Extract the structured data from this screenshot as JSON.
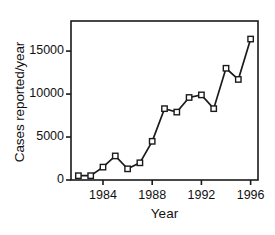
{
  "chart_data": {
    "type": "line",
    "title": "",
    "xlabel": "Year",
    "ylabel": "Cases reported/year",
    "xlim": [
      1981.4,
      1996.6
    ],
    "ylim": [
      0,
      18500
    ],
    "grid": false,
    "legend": null,
    "xticks": [
      1984,
      1988,
      1992,
      1996
    ],
    "xticklabels": [
      "1984",
      "1988",
      "1992",
      "1996"
    ],
    "yticks": [
      0,
      5000,
      10000,
      15000
    ],
    "yticklabels": [
      "0",
      "5000",
      "10000",
      "15000"
    ],
    "marker": "open-square",
    "line_color": "#1a1a1a",
    "marker_face_color": "#ffffff",
    "marker_edge_color": "#1a1a1a",
    "x": [
      1982,
      1983,
      1984,
      1985,
      1986,
      1987,
      1988,
      1989,
      1990,
      1991,
      1992,
      1993,
      1994,
      1995,
      1996
    ],
    "values": [
      500,
      500,
      1500,
      2800,
      1300,
      2000,
      4500,
      8300,
      7900,
      9600,
      9900,
      8300,
      13000,
      11700,
      16400
    ],
    "series": [
      {
        "name": "Cases reported/year",
        "values": [
          500,
          500,
          1500,
          2800,
          1300,
          2000,
          4500,
          8300,
          7900,
          9600,
          9900,
          8300,
          13000,
          11700,
          16400
        ]
      }
    ]
  },
  "axes": {
    "frame_color": "#1a1a1a"
  }
}
